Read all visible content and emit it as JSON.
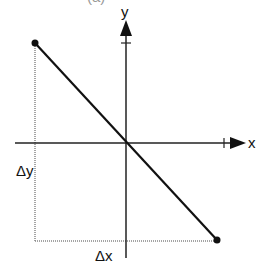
{
  "diagram": {
    "top_caption_partial": "(a)",
    "axes": {
      "x_label": "x",
      "y_label": "y"
    },
    "annotations": {
      "delta_x": "Δx",
      "delta_y": "Δy"
    },
    "points": [
      {
        "name": "start",
        "x": 35,
        "y": 43
      },
      {
        "name": "end",
        "x": 217,
        "y": 240
      }
    ],
    "colors": {
      "line": "#111111",
      "dotted": "#888888",
      "background": "#ffffff"
    }
  }
}
